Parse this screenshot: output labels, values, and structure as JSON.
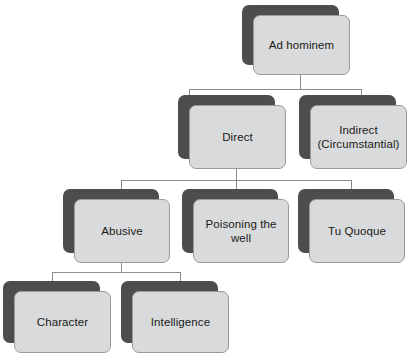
{
  "diagram": {
    "background_color": "#ffffff",
    "node_fill_color": "#d9dadb",
    "node_shadow_color": "#4d4d4d",
    "node_border_color": "#9a9a9a",
    "connector_color": "#8c8c8c",
    "text_color": "#1a1a1a"
  },
  "nodes": {
    "root": {
      "label": "Ad hominem"
    },
    "direct": {
      "label": "Direct"
    },
    "indirect": {
      "label": "Indirect\n(Circumstantial)"
    },
    "abusive": {
      "label": "Abusive"
    },
    "poisoning_the_well": {
      "label": "Poisoning the\nwell"
    },
    "tu_quoque": {
      "label": "Tu Quoque"
    },
    "character": {
      "label": "Character"
    },
    "intelligence": {
      "label": "Intelligence"
    }
  },
  "edges": [
    {
      "from": "root",
      "to": "direct"
    },
    {
      "from": "root",
      "to": "indirect"
    },
    {
      "from": "direct",
      "to": "abusive"
    },
    {
      "from": "direct",
      "to": "poisoning_the_well"
    },
    {
      "from": "direct",
      "to": "tu_quoque"
    },
    {
      "from": "abusive",
      "to": "character"
    },
    {
      "from": "abusive",
      "to": "intelligence"
    }
  ]
}
